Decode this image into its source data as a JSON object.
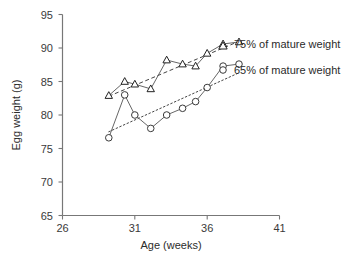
{
  "chart_data": {
    "type": "line",
    "title": "",
    "xlabel": "Age (weeks)",
    "ylabel": "Egg weight (g)",
    "xlim": [
      26,
      41
    ],
    "ylim": [
      65,
      95
    ],
    "xticks": [
      26,
      31,
      36,
      41
    ],
    "yticks": [
      65,
      70,
      75,
      80,
      85,
      90,
      95
    ],
    "grid": false,
    "legend_position": "right-inside",
    "series": [
      {
        "name": "75% of mature weight",
        "marker": "triangle",
        "line_style": "solid",
        "trend_style": "dashed",
        "x": [
          29.2,
          30.3,
          31.0,
          32.1,
          33.2,
          34.3,
          35.2,
          36.0,
          37.1,
          38.2
        ],
        "y": [
          82.9,
          85.0,
          84.6,
          83.9,
          88.2,
          87.6,
          87.3,
          89.2,
          90.6,
          90.9
        ],
        "trend_x": [
          29.2,
          38.2
        ],
        "trend_y": [
          82.8,
          91.0
        ]
      },
      {
        "name": "65% of mature weight",
        "marker": "circle",
        "line_style": "solid",
        "trend_style": "dotted",
        "x": [
          29.2,
          30.3,
          31.0,
          32.1,
          33.2,
          34.3,
          35.2,
          36.0,
          37.1,
          38.2
        ],
        "y": [
          76.6,
          83.0,
          80.0,
          78.0,
          80.0,
          81.0,
          82.0,
          84.1,
          87.3,
          87.6
        ],
        "trend_x": [
          29.2,
          38.2
        ],
        "trend_y": [
          77.5,
          86.3
        ]
      }
    ],
    "legend": [
      {
        "label": "75% of mature weight",
        "marker": "triangle"
      },
      {
        "label": "65% of mature weight",
        "marker": "circle"
      }
    ],
    "colors": {
      "axis": "#777777",
      "marker_stroke": "#333333",
      "line": "#555555",
      "text": "#2b2b2b"
    }
  },
  "axes": {
    "y_tick_95": "95",
    "y_tick_90": "90",
    "y_tick_85": "85",
    "y_tick_80": "80",
    "y_tick_75": "75",
    "y_tick_70": "70",
    "y_tick_65": "65",
    "x_tick_26": "26",
    "x_tick_31": "31",
    "x_tick_36": "36",
    "x_tick_41": "41",
    "x_title": "Age (weeks)",
    "y_title": "Egg weight (g)"
  },
  "legend": {
    "item_75": "75% of mature weight",
    "item_65": "65% of mature weight"
  }
}
